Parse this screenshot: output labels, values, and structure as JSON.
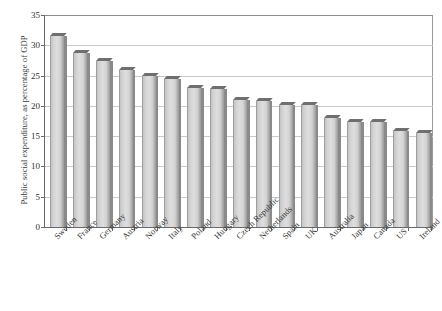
{
  "figure": {
    "page_fragment": "",
    "ylabel": "Public social expenditure, as percentage of GDP"
  },
  "axes": {
    "y_ticks": [
      "0",
      "5",
      "10",
      "15",
      "20",
      "25",
      "30",
      "35"
    ],
    "y_min": 0,
    "y_max": 35,
    "y_step": 5
  },
  "chart_data": {
    "type": "bar",
    "title": "",
    "xlabel": "",
    "ylabel": "Public social expenditure, as percentage of GDP",
    "ylim": [
      0,
      35
    ],
    "ytick_step": 5,
    "grid": true,
    "legend": "none",
    "orientation": "vertical",
    "style": "3d-shaded-grey-bars",
    "categories": [
      "Sweden",
      "France",
      "Germany",
      "Austria",
      "Norway",
      "Italy",
      "Poland",
      "Hungary",
      "Czech Republic",
      "Netherlands",
      "Spain",
      "UK",
      "Australia",
      "Japan",
      "Canada",
      "US",
      "Ireland"
    ],
    "values": [
      31.5,
      28.8,
      27.4,
      26.0,
      24.9,
      24.4,
      23.0,
      22.8,
      21.0,
      20.8,
      20.1,
      20.1,
      18.0,
      17.3,
      17.3,
      15.8,
      15.5
    ],
    "values_unit": "percent of GDP"
  },
  "colors": {
    "bar_face": "#d8d8d8",
    "bar_top": "#6f6f6f",
    "bar_side": "#8a8a8a",
    "axis": "#6a6a6a",
    "gridline": "#c9c9c9",
    "text": "#2f2f2f",
    "background": "#ffffff"
  }
}
